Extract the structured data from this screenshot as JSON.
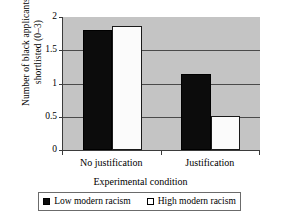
{
  "chart_data": {
    "type": "bar",
    "title": "",
    "xlabel": "Experimental condition",
    "ylabel": "Number of black applicants shortlisted (0–3)",
    "categories": [
      "No justification",
      "Justification"
    ],
    "series": [
      {
        "name": "Low modern racism",
        "color": "#0c0c0c",
        "values": [
          1.8,
          1.14
        ]
      },
      {
        "name": "High modern racism",
        "color": "#ffffff",
        "values": [
          1.86,
          0.51
        ]
      }
    ],
    "ylim": [
      0,
      2
    ],
    "yticks": [
      0,
      0.5,
      1,
      1.5,
      2
    ],
    "ytick_labels": [
      "0",
      "0.5",
      "1",
      "1.5",
      "2"
    ],
    "grid": "horizontal",
    "legend_position": "bottom",
    "plot_background": "#c4c4c4",
    "axis_color": "#3b3b3b"
  },
  "axes": {
    "y_title": "Number of black applicants shortlisted (0–3)",
    "x_title": "Experimental condition",
    "ytick_0": "0",
    "ytick_1": "0.5",
    "ytick_2": "1",
    "ytick_3": "1.5",
    "ytick_4": "2",
    "xtick_0": "No justification",
    "xtick_1": "Justification"
  },
  "legend": {
    "entries": [
      {
        "label": "Low modern racism",
        "swatch": "black-square-swatch"
      },
      {
        "label": "High modern racism",
        "swatch": "white-square-swatch"
      }
    ]
  }
}
